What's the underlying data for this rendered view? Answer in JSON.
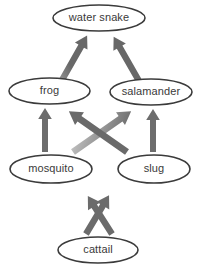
{
  "diagram": {
    "type": "food-web",
    "background_color": "#ffffff",
    "node_outline_color": "#3b3b3b",
    "node_fill_color": "#ffffff",
    "label_color": "#3a3a3a",
    "arrow_color_head": "#6e6e6e",
    "arrow_color_tail": "#f2f2f2",
    "nodes": [
      {
        "id": "water-snake",
        "label": "water snake",
        "cx": 99,
        "cy": 18,
        "rx": 46,
        "ry": 13,
        "trophic_level": "top predator"
      },
      {
        "id": "frog",
        "label": "frog",
        "cx": 49.5,
        "cy": 91,
        "rx": 40.5,
        "ry": 13,
        "trophic_level": "secondary consumer"
      },
      {
        "id": "salamander",
        "label": "salamander",
        "cx": 151,
        "cy": 92,
        "rx": 41,
        "ry": 13,
        "trophic_level": "secondary consumer"
      },
      {
        "id": "mosquito",
        "label": "mosquito",
        "cx": 51,
        "cy": 169,
        "rx": 41,
        "ry": 14,
        "trophic_level": "primary consumer"
      },
      {
        "id": "slug",
        "label": "slug",
        "cx": 154,
        "cy": 169,
        "rx": 36,
        "ry": 14,
        "trophic_level": "primary consumer"
      },
      {
        "id": "cattail",
        "label": "cattail",
        "cx": 98,
        "cy": 250,
        "rx": 40,
        "ry": 13,
        "trophic_level": "producer"
      }
    ],
    "arrows": [
      {
        "id": "cattail-to-mosquito",
        "from": "cattail",
        "to": "mosquito",
        "x1": 86,
        "y1": 234,
        "x2": 58,
        "y2": 187,
        "meaning": "energy flows from cattail to mosquito"
      },
      {
        "id": "cattail-to-slug",
        "from": "cattail",
        "to": "slug",
        "x1": 112,
        "y1": 234,
        "x2": 142,
        "y2": 187,
        "meaning": "energy flows from cattail to slug"
      },
      {
        "id": "mosquito-to-frog",
        "from": "mosquito",
        "to": "frog",
        "x1": 45,
        "y1": 152,
        "x2": 45,
        "y2": 106,
        "meaning": "energy flows from mosquito to frog"
      },
      {
        "id": "slug-to-salamander",
        "from": "slug",
        "to": "salamander",
        "x1": 153,
        "y1": 152,
        "x2": 153,
        "y2": 107,
        "meaning": "energy flows from slug to salamander"
      },
      {
        "id": "mosquito-to-salamander",
        "from": "mosquito",
        "to": "salamander",
        "x1": 72,
        "y1": 150,
        "x2": 131,
        "y2": 109,
        "meaning": "energy flows from mosquito to salamander"
      },
      {
        "id": "slug-to-frog",
        "from": "slug",
        "to": "frog",
        "x1": 128,
        "y1": 150,
        "x2": 69,
        "y2": 109,
        "meaning": "energy flows from slug to frog"
      },
      {
        "id": "frog-to-water-snake",
        "from": "frog",
        "to": "water-snake",
        "x1": 62,
        "y1": 79,
        "x2": 88,
        "y2": 33,
        "meaning": "energy flows from frog to water snake"
      },
      {
        "id": "salamander-to-water-snake",
        "from": "salamander",
        "to": "water-snake",
        "x1": 139,
        "y1": 80,
        "x2": 112,
        "y2": 33,
        "meaning": "energy flows from salamander to water snake"
      }
    ]
  }
}
